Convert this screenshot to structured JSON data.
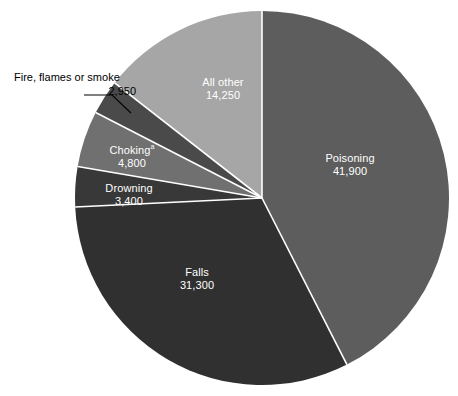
{
  "chart_data": {
    "type": "pie",
    "title": "",
    "subtitle": "",
    "xlabel": "",
    "ylabel": "",
    "legend_position": "none",
    "grid": false,
    "total": 98600,
    "start_angle_deg": 0,
    "direction": "clockwise",
    "categories": [
      "Poisoning",
      "Falls",
      "Drowning",
      "Choking",
      "Fire, flames or smoke",
      "All other"
    ],
    "values": [
      41900,
      31300,
      3400,
      4800,
      2950,
      14250
    ],
    "value_labels": [
      "41,900",
      "31,300",
      "3,400",
      "4,800",
      "2,950",
      "14,250"
    ],
    "colors": [
      "#5d5d5d",
      "#303030",
      "#383838",
      "#707070",
      "#4a4a4a",
      "#a6a6a6"
    ],
    "slices": [
      {
        "name": "Poisoning",
        "label": "Poisoning",
        "value": 41900,
        "value_label": "41,900",
        "color": "#5d5d5d",
        "angle_deg": 153.0,
        "percent": 42.5,
        "label_placement": "inside",
        "footnote_marker": ""
      },
      {
        "name": "Falls",
        "label": "Falls",
        "value": 31300,
        "value_label": "31,300",
        "color": "#303030",
        "angle_deg": 114.3,
        "percent": 31.7,
        "label_placement": "inside",
        "footnote_marker": ""
      },
      {
        "name": "Drowning",
        "label": "Drowning",
        "value": 3400,
        "value_label": "3,400",
        "color": "#383838",
        "angle_deg": 12.4,
        "percent": 3.4,
        "label_placement": "inside",
        "footnote_marker": ""
      },
      {
        "name": "Choking",
        "label": "Choking",
        "value": 4800,
        "value_label": "4,800",
        "color": "#707070",
        "angle_deg": 17.5,
        "percent": 4.9,
        "label_placement": "inside",
        "footnote_marker": "a"
      },
      {
        "name": "Fire, flames or smoke",
        "label": "Fire, flames or smoke",
        "value": 2950,
        "value_label": "2,950",
        "color": "#4a4a4a",
        "angle_deg": 10.8,
        "percent": 3.0,
        "label_placement": "callout",
        "footnote_marker": ""
      },
      {
        "name": "All other",
        "label": "All other",
        "value": 14250,
        "value_label": "14,250",
        "color": "#a6a6a6",
        "angle_deg": 52.0,
        "percent": 14.5,
        "label_placement": "inside",
        "footnote_marker": ""
      }
    ]
  },
  "chart": {
    "center_x": 262,
    "center_y": 198,
    "radius": 187,
    "separator_color": "#ffffff",
    "background": "#ffffff",
    "callout_line_color": "#000000"
  }
}
